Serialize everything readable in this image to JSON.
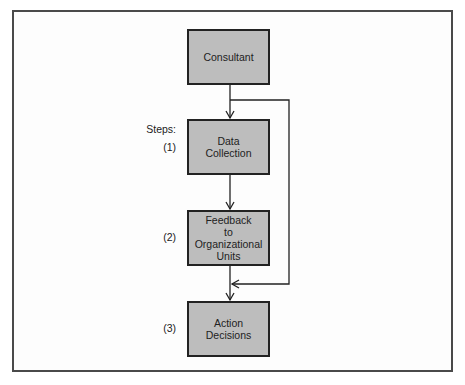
{
  "diagram": {
    "nodes": [
      {
        "id": "consultant",
        "lines": [
          "Consultant"
        ]
      },
      {
        "id": "data-collection",
        "lines": [
          "Data",
          "Collection"
        ]
      },
      {
        "id": "feedback",
        "lines": [
          "Feedback",
          "to",
          "Organizational",
          "Units"
        ]
      },
      {
        "id": "action-decisions",
        "lines": [
          "Action",
          "Decisions"
        ]
      }
    ],
    "labels": {
      "steps": "Steps:",
      "step1": "(1)",
      "step2": "(2)",
      "step3": "(3)"
    },
    "edges": [
      {
        "from": "consultant",
        "to": "data-collection"
      },
      {
        "from": "data-collection",
        "to": "feedback"
      },
      {
        "from": "feedback",
        "to": "action-decisions"
      },
      {
        "from": "consultant",
        "to": "action-decisions",
        "route": "bypass-right"
      }
    ],
    "colors": {
      "box_fill": "#bdbdbd",
      "border": "#222222",
      "frame": "#4a4a4a"
    }
  }
}
